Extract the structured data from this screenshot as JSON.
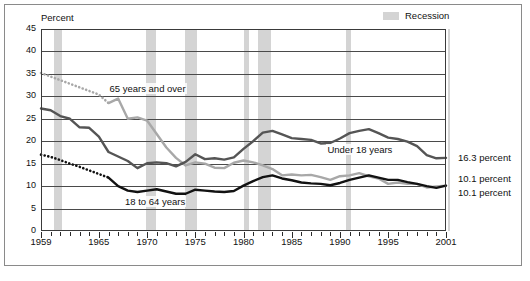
{
  "legend": {
    "recession_label": "Recession",
    "recession_color": "#d4d4d4"
  },
  "chart_data": {
    "type": "line",
    "title": "",
    "subtitle": "",
    "xlabel": "",
    "ylabel": "Percent",
    "ylim": [
      0,
      45
    ],
    "ytick_step": 5,
    "ytick_labels": [
      "0",
      "5",
      "10",
      "15",
      "20",
      "25",
      "30",
      "35",
      "40",
      "45"
    ],
    "xlim": [
      1959,
      2001
    ],
    "xtick_labels": [
      "1959",
      "1965",
      "1970",
      "1975",
      "1980",
      "1985",
      "1990",
      "1995",
      "2001"
    ],
    "xtick_values": [
      1959,
      1965,
      1970,
      1975,
      1980,
      1985,
      1990,
      1995,
      2001
    ],
    "grid": "horizontal",
    "legend_position": "top-right",
    "annotations": [
      {
        "text": "65 years and over",
        "x": 1966.0,
        "y": 31.6
      },
      {
        "text": "Under 18 years",
        "x": 1988.6,
        "y": 18.1
      },
      {
        "text": "18 to 64 years",
        "x": 1967.6,
        "y": 6.4
      }
    ],
    "end_labels": [
      {
        "text": "16.3 percent",
        "series": "Under 18 years",
        "value": 16.3
      },
      {
        "text": "10.1 percent",
        "series": "18 to 64 years",
        "value": 10.1
      },
      {
        "text": "10.1 percent",
        "series": "65 years and over",
        "value": 10.1
      }
    ],
    "recessions": [
      {
        "start": 1960.3,
        "end": 1961.2
      },
      {
        "start": 1969.9,
        "end": 1970.9
      },
      {
        "start": 1973.9,
        "end": 1975.2
      },
      {
        "start": 1980.1,
        "end": 1980.6
      },
      {
        "start": 1981.5,
        "end": 1982.9
      },
      {
        "start": 1990.6,
        "end": 1991.2
      },
      {
        "start": 2001.2,
        "end": 2001.9
      }
    ],
    "x": [
      1959,
      1960,
      1961,
      1962,
      1963,
      1964,
      1965,
      1966,
      1967,
      1968,
      1969,
      1970,
      1971,
      1972,
      1973,
      1974,
      1975,
      1976,
      1977,
      1978,
      1979,
      1980,
      1981,
      1982,
      1983,
      1984,
      1985,
      1986,
      1987,
      1988,
      1989,
      1990,
      1991,
      1992,
      1993,
      1994,
      1995,
      1996,
      1997,
      1998,
      1999,
      2000,
      2001
    ],
    "series": [
      {
        "name": "65 years and over",
        "color": "#a8a8a8",
        "style_first_segment": "dotted",
        "dotted_through_year": 1966,
        "values": [
          35.2,
          34.4,
          33.6,
          32.8,
          32.0,
          31.2,
          30.4,
          28.5,
          29.5,
          25.0,
          25.3,
          24.6,
          21.6,
          18.6,
          16.3,
          14.6,
          15.3,
          15.0,
          14.1,
          14.0,
          15.2,
          15.7,
          15.3,
          14.6,
          13.8,
          12.4,
          12.6,
          12.4,
          12.5,
          12.0,
          11.4,
          12.2,
          12.4,
          12.9,
          12.2,
          11.7,
          10.5,
          10.8,
          10.5,
          10.5,
          9.7,
          9.9,
          10.1
        ]
      },
      {
        "name": "Under 18 years",
        "color": "#555555",
        "style_first_segment": "solid",
        "values": [
          27.3,
          26.9,
          25.6,
          25.0,
          23.1,
          23.0,
          21.0,
          17.6,
          16.6,
          15.6,
          14.0,
          15.1,
          15.3,
          15.1,
          14.4,
          15.4,
          17.1,
          16.0,
          16.2,
          15.9,
          16.4,
          18.3,
          20.0,
          21.9,
          22.3,
          21.5,
          20.7,
          20.5,
          20.3,
          19.5,
          19.6,
          20.6,
          21.8,
          22.3,
          22.7,
          21.8,
          20.8,
          20.5,
          19.9,
          18.9,
          16.9,
          16.2,
          16.3
        ]
      },
      {
        "name": "18 to 64 years",
        "color": "#121212",
        "style_first_segment": "dotted",
        "dotted_through_year": 1966,
        "values": [
          17.0,
          16.5,
          15.8,
          15.0,
          14.3,
          13.5,
          12.7,
          11.9,
          10.0,
          9.0,
          8.7,
          9.0,
          9.3,
          8.8,
          8.3,
          8.3,
          9.2,
          9.0,
          8.8,
          8.7,
          8.9,
          10.1,
          11.1,
          12.0,
          12.4,
          11.7,
          11.3,
          10.8,
          10.6,
          10.5,
          10.2,
          10.7,
          11.4,
          11.9,
          12.4,
          11.9,
          11.4,
          11.4,
          10.9,
          10.5,
          10.0,
          9.6,
          10.1
        ]
      }
    ]
  }
}
